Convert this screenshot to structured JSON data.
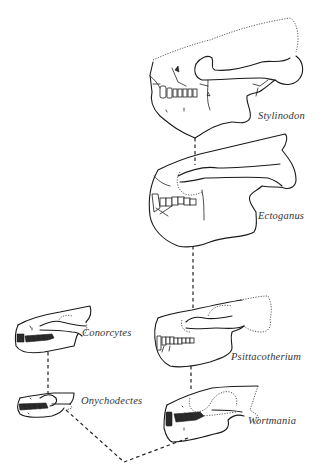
{
  "figure": {
    "colors": {
      "background": "#ffffff",
      "ink": "#1a1a1a",
      "label": "#333333"
    }
  },
  "taxa": [
    {
      "id": "stylinodon",
      "label": "Stylinodon"
    },
    {
      "id": "ectoganus",
      "label": "Ectoganus"
    },
    {
      "id": "psittacotherium",
      "label": "Psittacotherium"
    },
    {
      "id": "wortmania",
      "label": "Wortmania"
    },
    {
      "id": "conorcytes",
      "label": "Conorcytes"
    },
    {
      "id": "onychodectes",
      "label": "Onychodectes"
    }
  ],
  "connections": [
    {
      "from": "stylinodon",
      "to": "ectoganus",
      "style": "dashed"
    },
    {
      "from": "ectoganus",
      "to": "psittacotherium",
      "style": "dashed"
    },
    {
      "from": "psittacotherium",
      "to": "wortmania",
      "style": "dashed"
    },
    {
      "from": "conorcytes",
      "to": "onychodectes",
      "style": "dashed"
    },
    {
      "from": "onychodectes",
      "to": "common-ancestor",
      "style": "dashed"
    },
    {
      "from": "wortmania",
      "to": "common-ancestor",
      "style": "dashed"
    }
  ]
}
